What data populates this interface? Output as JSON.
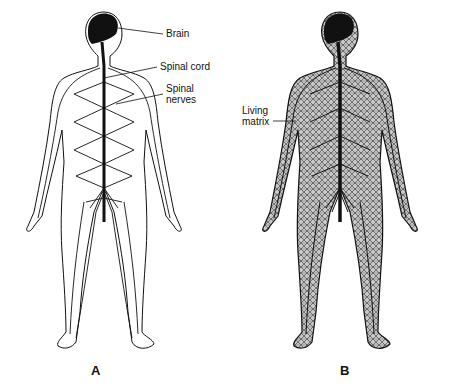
{
  "figure": {
    "panels": [
      {
        "id": "A",
        "label": "A",
        "description": "Nervous system: brain, spinal cord and spinal nerves",
        "annotations": [
          {
            "text": "Brain"
          },
          {
            "text": "Spinal cord"
          },
          {
            "text": "Spinal\nnerves"
          }
        ]
      },
      {
        "id": "B",
        "label": "B",
        "description": "Living matrix network throughout the body",
        "annotations": [
          {
            "text": "Living\nmatrix"
          }
        ]
      }
    ],
    "colors": {
      "line": "#111111",
      "background": "#ffffff",
      "matrix_fill": "#bdbdbd"
    }
  }
}
